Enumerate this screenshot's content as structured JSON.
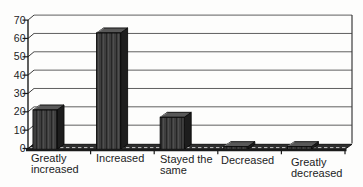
{
  "chart_data": {
    "type": "bar",
    "variant": "3d-column-grayscale-scan",
    "title": "",
    "subtitle": "",
    "xlabel": "",
    "ylabel": "",
    "categories": [
      "Greatly increased",
      "Increased",
      "Stayed the same",
      "Decreased",
      "Greatly decreased"
    ],
    "category_label_lines": [
      [
        "Greatly",
        "increased"
      ],
      [
        "Increased"
      ],
      [
        "Stayed the",
        "same"
      ],
      [
        "Decreased"
      ],
      [
        "Greatly",
        "decreased"
      ]
    ],
    "values": [
      21,
      63,
      17,
      1,
      1
    ],
    "ylim": [
      0,
      70
    ],
    "yticks": [
      0,
      10,
      20,
      30,
      40,
      50,
      60,
      70
    ],
    "grid": "horizontal",
    "legend": "none"
  },
  "colors": {
    "background": "#fdfdfc",
    "bar_front": "#3e3e3e",
    "bar_front_streak_dark": "#262626",
    "bar_front_streak_light": "#4f4f4f",
    "bar_top": "#585858",
    "bar_top_highlight": "#9a9a9a",
    "bar_side": "#1d1d1d",
    "bar_outline": "#0a0a0a",
    "gridline": "#5f5f5f",
    "wall_edge": "#3c3c3c",
    "axis": "#1a1a1a",
    "floor": "#2e2e2e",
    "floor_hatch_light": "#b8b8b8",
    "text": "#1c1c1c"
  }
}
